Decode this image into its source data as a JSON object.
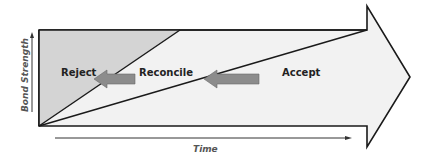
{
  "diagram": {
    "type": "bond-strength-over-time",
    "regions": [
      {
        "id": "reject",
        "label": "Reject",
        "fill": "#d4d4d4"
      },
      {
        "id": "reconcile",
        "label": "Reconcile",
        "fill": "#f2f2f2"
      },
      {
        "id": "accept",
        "label": "Accept",
        "fill": "#f2f2f2"
      }
    ],
    "axes": {
      "y_label": "Bond Strength",
      "x_label": "Time"
    },
    "transitions": [
      {
        "from": "reconcile",
        "to": "reject",
        "color": "#8c8c8c"
      },
      {
        "from": "accept",
        "to": "reconcile",
        "color": "#8c8c8c"
      }
    ],
    "colors": {
      "outline": "#1a1a1a",
      "arrow_fill": "#f2f2f2",
      "reject_fill": "#d4d4d4",
      "transition_arrow": "#8c8c8c"
    }
  }
}
